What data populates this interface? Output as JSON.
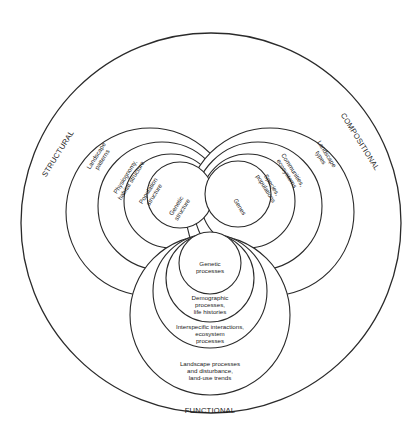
{
  "diagram": {
    "type": "nested-circles",
    "outer_circle": {
      "cx": 211,
      "cy": 223,
      "r": 190
    },
    "attributes": {
      "structural": "STRUCTURAL",
      "compositional": "COMPOSITIONAL",
      "functional": "FUNCTIONAL"
    },
    "structural_levels": [
      {
        "label_1": "Landscape",
        "label_2": "patterns"
      },
      {
        "label_1": "Physiognomy,",
        "label_2": "habitat structure"
      },
      {
        "label_1": "Population",
        "label_2": "structure"
      },
      {
        "label_1": "Genetic",
        "label_2": "structure"
      }
    ],
    "compositional_levels": [
      {
        "label_1": "Landscape",
        "label_2": "types"
      },
      {
        "label_1": "Communities,",
        "label_2": "ecosystems"
      },
      {
        "label_1": "Species,",
        "label_2": "populations"
      },
      {
        "label_1": "Genes",
        "label_2": ""
      }
    ],
    "functional_levels": [
      {
        "label_1": "Landscape processes",
        "label_2": "and disturbance,",
        "label_3": "land-use trends"
      },
      {
        "label_1": "Interspecific interactions,",
        "label_2": "ecosystem",
        "label_3": "processes"
      },
      {
        "label_1": "Demographic",
        "label_2": "processes,",
        "label_3": "life histories"
      },
      {
        "label_1": "Genetic",
        "label_2": "processes",
        "label_3": ""
      }
    ],
    "colors": {
      "line": "#2a2a2a",
      "background": "#ffffff",
      "text": "#1a1a1a"
    }
  }
}
